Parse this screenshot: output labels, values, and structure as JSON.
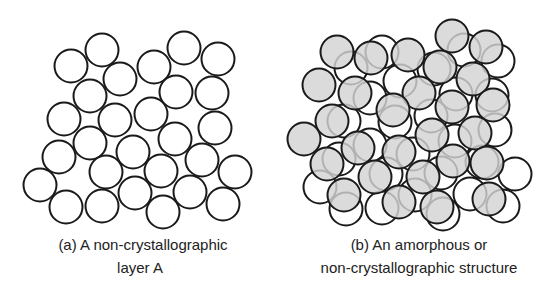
{
  "figure": {
    "colors": {
      "stroke": "#1a1a1a",
      "layer_a_fill": "#ffffff",
      "layer_b_fill": "#d3d3d3",
      "background": "#ffffff"
    },
    "circle_radius": 16.5,
    "panels": [
      {
        "id": "a",
        "caption_line1": "(a)  A non-crystallographic",
        "caption_line2": "layer A",
        "layer_a_offset": [
          0,
          0
        ],
        "show_layer_b": false
      },
      {
        "id": "b",
        "caption_line1": "(b)  An amorphous or",
        "caption_line2": "non-crystallographic structure",
        "layer_a_offset": [
          280,
          2
        ],
        "show_layer_b": true
      }
    ],
    "layer_a_circles": [
      [
        71,
        66
      ],
      [
        102,
        50
      ],
      [
        120,
        79
      ],
      [
        154,
        67
      ],
      [
        184,
        48
      ],
      [
        218,
        59
      ],
      [
        90,
        96
      ],
      [
        176,
        92
      ],
      [
        212,
        93
      ],
      [
        64,
        119
      ],
      [
        115,
        120
      ],
      [
        151,
        114
      ],
      [
        215,
        128
      ],
      [
        90,
        143
      ],
      [
        59,
        157
      ],
      [
        133,
        152
      ],
      [
        175,
        139
      ],
      [
        202,
        160
      ],
      [
        106,
        172
      ],
      [
        161,
        171
      ],
      [
        235,
        172
      ],
      [
        40,
        185
      ],
      [
        135,
        193
      ],
      [
        190,
        192
      ],
      [
        66,
        207
      ],
      [
        102,
        206
      ],
      [
        163,
        212
      ],
      [
        223,
        204
      ]
    ],
    "layer_b_circles": [
      [
        337,
        52
      ],
      [
        371,
        58
      ],
      [
        408,
        55
      ],
      [
        452,
        36
      ],
      [
        486,
        47
      ],
      [
        440,
        67
      ],
      [
        319,
        85
      ],
      [
        355,
        93
      ],
      [
        419,
        93
      ],
      [
        473,
        79
      ],
      [
        393,
        110
      ],
      [
        452,
        107
      ],
      [
        493,
        105
      ],
      [
        332,
        121
      ],
      [
        304,
        139
      ],
      [
        358,
        148
      ],
      [
        432,
        135
      ],
      [
        475,
        133
      ],
      [
        399,
        152
      ],
      [
        327,
        164
      ],
      [
        453,
        161
      ],
      [
        487,
        163
      ],
      [
        375,
        177
      ],
      [
        423,
        177
      ],
      [
        344,
        195
      ],
      [
        399,
        202
      ],
      [
        437,
        207
      ],
      [
        489,
        199
      ]
    ]
  }
}
